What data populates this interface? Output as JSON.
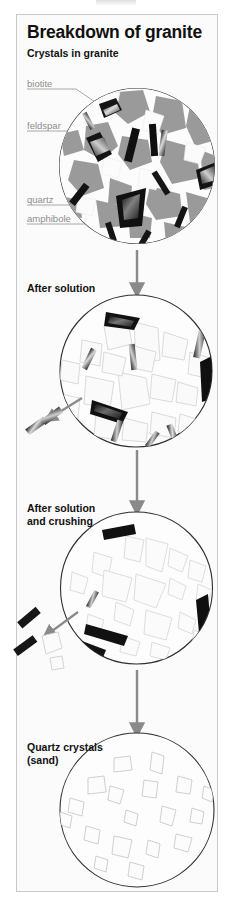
{
  "page": {
    "title": "Breakdown of granite",
    "background": "#ffffff",
    "panel_background": "#fbfbfb",
    "frame_color": "#c9c9c9",
    "label_color": "#8d8d8d",
    "heading_color": "#111111",
    "arrow_color": "#8a8a8a",
    "circle_outline_color": "#333333"
  },
  "sections": [
    {
      "id": "crystals-in-granite",
      "heading": "Crystals in granite"
    },
    {
      "id": "after-solution",
      "heading": "After solution"
    },
    {
      "id": "after-solution-and-crushing",
      "heading_line1": "After solution",
      "heading_line2": "and crushing"
    },
    {
      "id": "quartz-crystals-sand",
      "heading_line1": "Quartz crystals",
      "heading_line2": "(sand)"
    }
  ],
  "callouts": [
    {
      "id": "biotite",
      "label": "biotite"
    },
    {
      "id": "feldspar",
      "label": "feldspar"
    },
    {
      "id": "quartz",
      "label": "quartz"
    },
    {
      "id": "amphibole",
      "label": "amphibole"
    }
  ],
  "diagram_data": {
    "type": "diagram",
    "title": "Breakdown of granite",
    "description": "Four-stage vertical flow diagram showing granite weathering into quartz sand",
    "stages": [
      {
        "stage": 1,
        "label": "Crystals in granite",
        "minerals": [
          "biotite",
          "feldspar",
          "quartz",
          "amphibole"
        ],
        "note": "Interlocking crystals: mid-gray feldspar, white quartz, black biotite and amphibole"
      },
      {
        "stage": 2,
        "label": "After solution",
        "note": "Feldspar dissolved; pale outlined quartz grains and dark mica/amphibole shards remain; some fragments released"
      },
      {
        "stage": 3,
        "label": "After solution and crushing",
        "note": "Fragments smaller and more separated; dark shards and quartz grains escaping"
      },
      {
        "stage": 4,
        "label": "Quartz crystals (sand)",
        "note": "Only rounded pale quartz grains remain"
      }
    ],
    "flow": "top-to-bottom",
    "arrows": 3
  }
}
